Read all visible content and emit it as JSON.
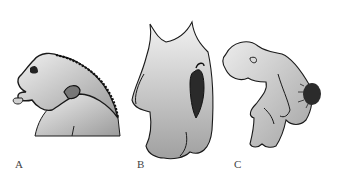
{
  "figure": {
    "panels": [
      {
        "id": "A",
        "label": "A",
        "subject": "head-profile-with-neck-mass"
      },
      {
        "id": "B",
        "label": "B",
        "subject": "back-with-spinal-lesion"
      },
      {
        "id": "C",
        "label": "C",
        "subject": "crouching-infant-with-lumbar-mass"
      }
    ]
  },
  "colors": {
    "fill_light": "#e4e4e4",
    "fill_mid": "#b8b8b8",
    "fill_dark": "#999999",
    "outline": "#1a1a1a",
    "lesion": "#2a2a2a"
  }
}
